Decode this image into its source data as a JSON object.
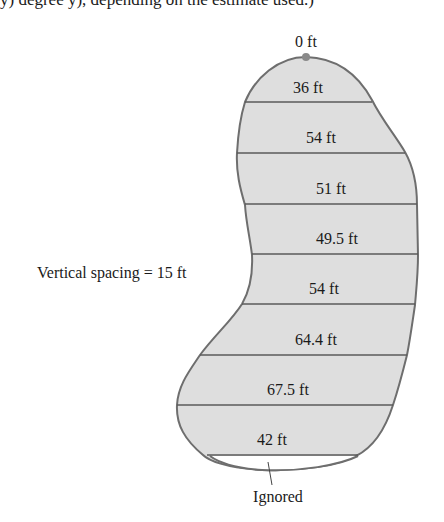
{
  "caption_fragment": "y) degree y), depending on the estimate used.)",
  "figure": {
    "top_label": "0 ft",
    "spacing_label": "Vertical spacing = 15 ft",
    "bottom_label": "Ignored",
    "widths": [
      {
        "label": "36 ft",
        "value": 36
      },
      {
        "label": "54 ft",
        "value": 54
      },
      {
        "label": "51 ft",
        "value": 51
      },
      {
        "label": "49.5 ft",
        "value": 49.5
      },
      {
        "label": "54 ft",
        "value": 54
      },
      {
        "label": "64.4 ft",
        "value": 64.4
      },
      {
        "label": "67.5 ft",
        "value": 67.5
      },
      {
        "label": "42 ft",
        "value": 42
      }
    ],
    "vertical_spacing_ft": 15,
    "colors": {
      "fill": "#dedede",
      "outline": "#6e6e6e",
      "lines": "#5a5a5a",
      "dot": "#8a8a8a"
    }
  }
}
